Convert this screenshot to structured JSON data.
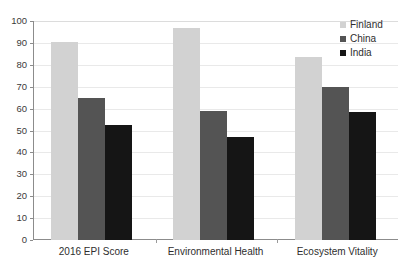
{
  "chart_data": {
    "type": "bar",
    "title": "",
    "subtitle": "",
    "xlabel": "",
    "ylabel": "",
    "categories": [
      "2016 EPI Score",
      "Environmental Health",
      "Ecosystem Vitality"
    ],
    "series": [
      {
        "name": "Finland",
        "values": [
          90.5,
          97.0,
          83.5
        ],
        "color": "#d2d2d2"
      },
      {
        "name": "China",
        "values": [
          65.0,
          59.0,
          70.0
        ],
        "color": "#545454"
      },
      {
        "name": "India",
        "values": [
          52.5,
          47.0,
          58.5
        ],
        "color": "#151515"
      }
    ],
    "ylim": [
      0,
      100
    ],
    "ytick_step": 10,
    "yticks": [
      "100",
      "90",
      "80",
      "70",
      "60",
      "50",
      "40",
      "30",
      "20",
      "10",
      "0"
    ],
    "grid": true,
    "grid_axis": "y",
    "legend_position": "top-right",
    "axis_color": "#8c8c8c",
    "grid_color": "#e9e9e9",
    "background": "#ffffff",
    "text_color": "#2e2e2e"
  },
  "legend": {
    "items": [
      {
        "label": "Finland"
      },
      {
        "label": "China"
      },
      {
        "label": "India"
      }
    ]
  }
}
